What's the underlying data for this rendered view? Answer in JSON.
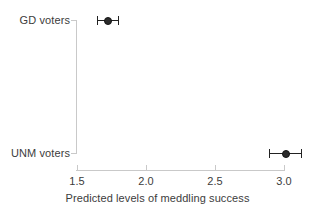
{
  "chart_data": {
    "type": "scatter",
    "title": "",
    "subtitle": "",
    "xlabel": "Predicted levels of meddling success",
    "ylabel": "",
    "xlim": [
      1.5,
      3.15
    ],
    "xticks": [
      1.5,
      2.0,
      2.5,
      3.0
    ],
    "xtick_labels": [
      "1.5",
      "2.0",
      "2.5",
      "3.0"
    ],
    "categories": [
      "GD voters",
      "UNM voters"
    ],
    "grid": false,
    "legend": null,
    "annotations": [],
    "points": [
      {
        "category": "GD voters",
        "estimate": 1.72,
        "ci_low": 1.645,
        "ci_high": 1.8
      },
      {
        "category": "UNM voters",
        "estimate": 3.01,
        "ci_low": 2.89,
        "ci_high": 3.12
      }
    ],
    "marker_color": "#2b2b2b",
    "axis_color": "#c9c9c9",
    "text_color": "#3c3c3c"
  },
  "axis": {
    "x_title": "Predicted levels of meddling success",
    "tick_1": "1.5",
    "tick_2": "2.0",
    "tick_3": "2.5",
    "tick_4": "3.0"
  },
  "categories": {
    "gd": "GD voters",
    "unm": "UNM voters"
  }
}
